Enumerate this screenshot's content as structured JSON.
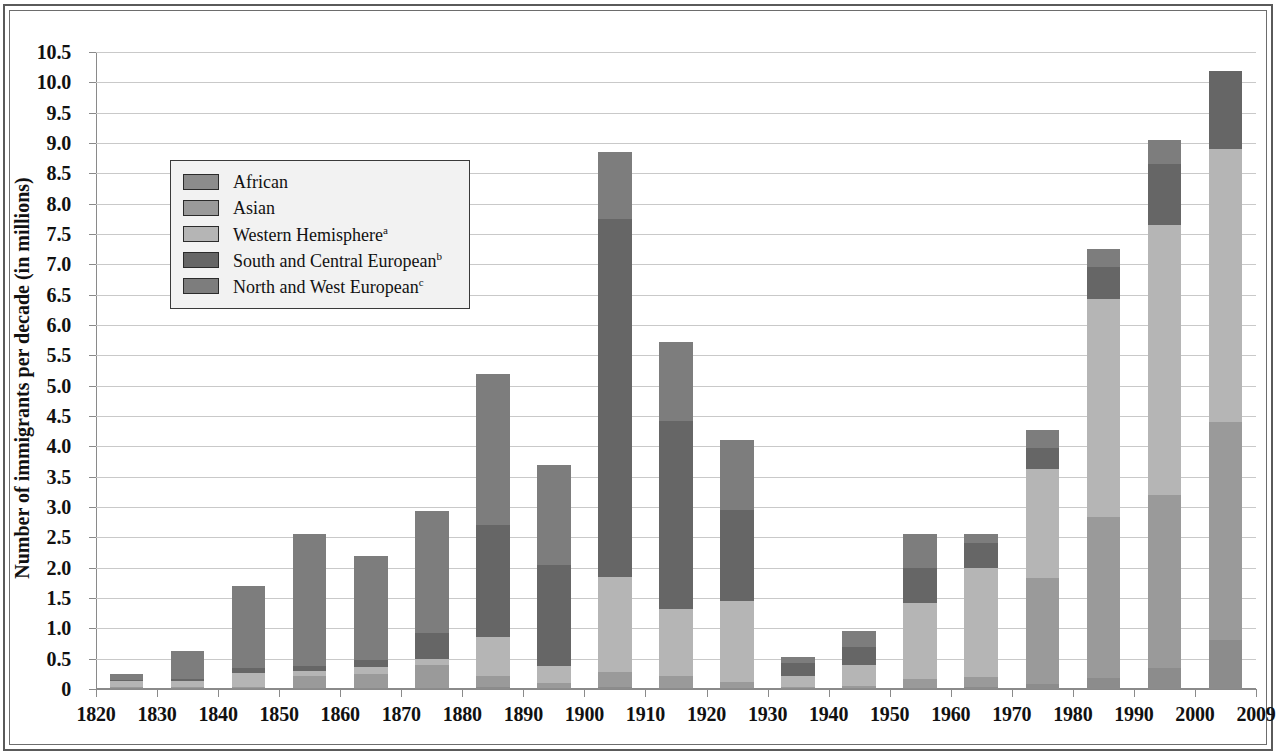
{
  "chart_data": {
    "type": "bar",
    "subtype": "stacked",
    "title": "",
    "xlabel": "",
    "ylabel": "Number of immigrants per decade (in millions)",
    "ylim": [
      0,
      10.5
    ],
    "ytick_step": 0.5,
    "yticks": [
      "0",
      "0.5",
      "1.0",
      "1.5",
      "2.0",
      "2.5",
      "3.0",
      "3.5",
      "4.0",
      "4.5",
      "5.0",
      "5.5",
      "6.0",
      "6.5",
      "7.0",
      "7.5",
      "8.0",
      "8.5",
      "9.0",
      "9.5",
      "10.0",
      "10.5"
    ],
    "grid": true,
    "legend_position": "upper-left-inside",
    "categories": [
      "1820",
      "1830",
      "1840",
      "1850",
      "1860",
      "1870",
      "1880",
      "1890",
      "1900",
      "1910",
      "1920",
      "1930",
      "1940",
      "1950",
      "1960",
      "1970",
      "1980",
      "1990",
      "2000",
      "2009"
    ],
    "xtick_labels": [
      "1820",
      "1830",
      "1840",
      "1850",
      "1860",
      "1870",
      "1880",
      "1890",
      "1900",
      "1910",
      "1920",
      "1930",
      "1940",
      "1950",
      "1960",
      "1970",
      "1980",
      "1990",
      "2000",
      "2009"
    ],
    "series": [
      {
        "name": "North and West European",
        "color": "#7d7d7d",
        "values": [
          0.1,
          0.45,
          1.35,
          2.2,
          1.75,
          2.05,
          2.1,
          1.35,
          1.25,
          0.65,
          0.45,
          0.1,
          0.1,
          0.55,
          0.45,
          0.3,
          0.2,
          0.18,
          0.15,
          0.0
        ]
      },
      {
        "name": "South and Central European",
        "color": "#666666",
        "values": [
          0.02,
          0.02,
          0.05,
          0.08,
          0.1,
          0.4,
          1.85,
          0.55,
          4.0,
          2.3,
          1.15,
          0.22,
          0.15,
          0.45,
          0.5,
          0.5,
          0.3,
          0.3,
          0.2,
          0.0
        ]
      },
      {
        "name": "Western Hemisphere",
        "color": "#b5b5b5",
        "values": [
          0.1,
          0.08,
          0.18,
          0.06,
          0.1,
          0.08,
          0.55,
          0.05,
          1.7,
          0.6,
          1.25,
          0.08,
          0.15,
          0.95,
          1.25,
          1.6,
          2.8,
          3.6,
          4.5,
          4.5
        ]
      },
      {
        "name": "Asian",
        "color": "#9a9a9a",
        "values": [
          0.01,
          0.02,
          0.02,
          0.18,
          0.22,
          0.38,
          0.45,
          0.12,
          0.18,
          0.02,
          0.1,
          0.04,
          0.02,
          0.15,
          0.35,
          1.4,
          1.6,
          2.85,
          3.6,
          3.6
        ]
      },
      {
        "name": "African",
        "color": "#8c8c8c",
        "values": [
          0.01,
          0.01,
          0.01,
          0.01,
          0.01,
          0.01,
          0.02,
          0.02,
          0.02,
          0.02,
          0.02,
          0.02,
          0.02,
          0.01,
          0.02,
          0.1,
          0.18,
          0.35,
          0.8,
          0.8
        ]
      }
    ],
    "totals": [
      0.25,
      0.62,
      1.7,
      2.55,
      2.2,
      2.93,
      5.2,
      3.7,
      8.85,
      5.72,
      4.1,
      0.53,
      0.95,
      2.55,
      2.55,
      4.27,
      7.25,
      9.05,
      10.18,
      10.18
    ],
    "bars": [
      {
        "decade": "1820",
        "total": 0.25,
        "stack": [
          {
            "series": "African",
            "value": 0.02
          },
          {
            "series": "Asian",
            "value": 0.01
          },
          {
            "series": "Western Hemisphere",
            "value": 0.1
          },
          {
            "series": "South and Central European",
            "value": 0.02
          },
          {
            "series": "North and West European",
            "value": 0.1
          }
        ]
      },
      {
        "decade": "1830",
        "total": 0.62,
        "stack": [
          {
            "series": "African",
            "value": 0.02
          },
          {
            "series": "Asian",
            "value": 0.02
          },
          {
            "series": "Western Hemisphere",
            "value": 0.1
          },
          {
            "series": "South and Central European",
            "value": 0.03
          },
          {
            "series": "North and West European",
            "value": 0.45
          }
        ]
      },
      {
        "decade": "1840",
        "total": 1.7,
        "stack": [
          {
            "series": "African",
            "value": 0.02
          },
          {
            "series": "Asian",
            "value": 0.02
          },
          {
            "series": "Western Hemisphere",
            "value": 0.23
          },
          {
            "series": "South and Central European",
            "value": 0.08
          },
          {
            "series": "North and West European",
            "value": 1.35
          }
        ]
      },
      {
        "decade": "1850",
        "total": 2.55,
        "stack": [
          {
            "series": "African",
            "value": 0.02
          },
          {
            "series": "Asian",
            "value": 0.2
          },
          {
            "series": "Western Hemisphere",
            "value": 0.08
          },
          {
            "series": "South and Central European",
            "value": 0.08
          },
          {
            "series": "North and West European",
            "value": 2.17
          }
        ]
      },
      {
        "decade": "1860",
        "total": 2.2,
        "stack": [
          {
            "series": "African",
            "value": 0.02
          },
          {
            "series": "Asian",
            "value": 0.22
          },
          {
            "series": "Western Hemisphere",
            "value": 0.12
          },
          {
            "series": "South and Central European",
            "value": 0.12
          },
          {
            "series": "North and West European",
            "value": 1.72
          }
        ]
      },
      {
        "decade": "1870",
        "total": 2.93,
        "stack": [
          {
            "series": "African",
            "value": 0.02
          },
          {
            "series": "Asian",
            "value": 0.38
          },
          {
            "series": "Western Hemisphere",
            "value": 0.1
          },
          {
            "series": "South and Central European",
            "value": 0.43
          },
          {
            "series": "North and West European",
            "value": 2.0
          }
        ]
      },
      {
        "decade": "1880",
        "total": 5.2,
        "stack": [
          {
            "series": "African",
            "value": 0.03
          },
          {
            "series": "Asian",
            "value": 0.18
          },
          {
            "series": "Western Hemisphere",
            "value": 0.65
          },
          {
            "series": "South and Central European",
            "value": 1.84
          },
          {
            "series": "North and West European",
            "value": 2.5
          }
        ]
      },
      {
        "decade": "1890",
        "total": 3.7,
        "stack": [
          {
            "series": "African",
            "value": 0.02
          },
          {
            "series": "Asian",
            "value": 0.08
          },
          {
            "series": "Western Hemisphere",
            "value": 0.28
          },
          {
            "series": "South and Central European",
            "value": 1.67
          },
          {
            "series": "North and West European",
            "value": 1.65
          }
        ]
      },
      {
        "decade": "1900",
        "total": 8.85,
        "stack": [
          {
            "series": "African",
            "value": 0.03
          },
          {
            "series": "Asian",
            "value": 0.25
          },
          {
            "series": "Western Hemisphere",
            "value": 1.57
          },
          {
            "series": "South and Central European",
            "value": 5.9
          },
          {
            "series": "North and West European",
            "value": 1.1
          }
        ]
      },
      {
        "decade": "1910",
        "total": 5.72,
        "stack": [
          {
            "series": "African",
            "value": 0.02
          },
          {
            "series": "Asian",
            "value": 0.2
          },
          {
            "series": "Western Hemisphere",
            "value": 1.1
          },
          {
            "series": "South and Central European",
            "value": 3.1
          },
          {
            "series": "North and West European",
            "value": 1.3
          }
        ]
      },
      {
        "decade": "1920",
        "total": 4.1,
        "stack": [
          {
            "series": "African",
            "value": 0.02
          },
          {
            "series": "Asian",
            "value": 0.1
          },
          {
            "series": "Western Hemisphere",
            "value": 1.33
          },
          {
            "series": "South and Central European",
            "value": 1.5
          },
          {
            "series": "North and West European",
            "value": 1.15
          }
        ]
      },
      {
        "decade": "1930",
        "total": 0.53,
        "stack": [
          {
            "series": "African",
            "value": 0.01
          },
          {
            "series": "Asian",
            "value": 0.03
          },
          {
            "series": "Western Hemisphere",
            "value": 0.17
          },
          {
            "series": "South and Central European",
            "value": 0.22
          },
          {
            "series": "North and West European",
            "value": 0.1
          }
        ]
      },
      {
        "decade": "1940",
        "total": 0.95,
        "stack": [
          {
            "series": "African",
            "value": 0.01
          },
          {
            "series": "Asian",
            "value": 0.04
          },
          {
            "series": "Western Hemisphere",
            "value": 0.35
          },
          {
            "series": "South and Central European",
            "value": 0.3
          },
          {
            "series": "North and West European",
            "value": 0.25
          }
        ]
      },
      {
        "decade": "1950",
        "total": 2.55,
        "stack": [
          {
            "series": "African",
            "value": 0.01
          },
          {
            "series": "Asian",
            "value": 0.15
          },
          {
            "series": "Western Hemisphere",
            "value": 1.26
          },
          {
            "series": "South and Central European",
            "value": 0.58
          },
          {
            "series": "North and West European",
            "value": 0.55
          }
        ]
      },
      {
        "decade": "1960",
        "total": 2.55,
        "stack": [
          {
            "series": "African",
            "value": 0.03
          },
          {
            "series": "Asian",
            "value": 0.17
          },
          {
            "series": "Western Hemisphere",
            "value": 1.8
          },
          {
            "series": "South and Central European",
            "value": 0.4
          },
          {
            "series": "North and West European",
            "value": 0.15
          }
        ]
      },
      {
        "decade": "1970",
        "total": 4.27,
        "stack": [
          {
            "series": "African",
            "value": 0.08
          },
          {
            "series": "Asian",
            "value": 1.75
          },
          {
            "series": "Western Hemisphere",
            "value": 1.8
          },
          {
            "series": "South and Central European",
            "value": 0.35
          },
          {
            "series": "North and West European",
            "value": 0.29
          }
        ]
      },
      {
        "decade": "1980",
        "total": 7.25,
        "stack": [
          {
            "series": "African",
            "value": 0.18
          },
          {
            "series": "Asian",
            "value": 2.65
          },
          {
            "series": "Western Hemisphere",
            "value": 3.6
          },
          {
            "series": "South and Central European",
            "value": 0.52
          },
          {
            "series": "North and West European",
            "value": 0.3
          }
        ]
      },
      {
        "decade": "1990",
        "total": 9.05,
        "stack": [
          {
            "series": "African",
            "value": 0.35
          },
          {
            "series": "Asian",
            "value": 2.85
          },
          {
            "series": "Western Hemisphere",
            "value": 4.45
          },
          {
            "series": "South and Central European",
            "value": 1.0
          },
          {
            "series": "North and West European",
            "value": 0.4
          }
        ]
      },
      {
        "decade": "2000",
        "total": 10.18,
        "stack": [
          {
            "series": "African",
            "value": 0.8
          },
          {
            "series": "Asian",
            "value": 3.6
          },
          {
            "series": "Western Hemisphere",
            "value": 4.5
          },
          {
            "series": "South and Central European",
            "value": 1.28
          },
          {
            "series": "North and West European",
            "value": 0.0
          }
        ]
      }
    ]
  },
  "legend": {
    "items": [
      {
        "label": "African",
        "note": "",
        "color": "#8c8c8c"
      },
      {
        "label": "Asian",
        "note": "",
        "color": "#9a9a9a"
      },
      {
        "label": "Western Hemisphere",
        "note": "a",
        "color": "#b5b5b5"
      },
      {
        "label": "South and Central European",
        "note": "b",
        "color": "#666666"
      },
      {
        "label": "North and West European",
        "note": "c",
        "color": "#7d7d7d"
      }
    ]
  }
}
